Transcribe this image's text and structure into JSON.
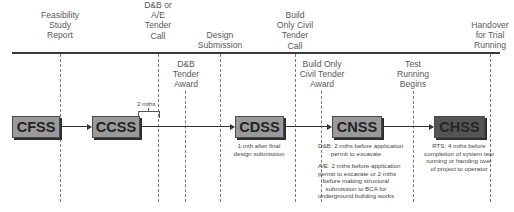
{
  "diagram": {
    "top_milestones": [
      {
        "id": "feasibility",
        "lines": [
          "Feasibility",
          "Study",
          "Report"
        ]
      },
      {
        "id": "dnb-ae-tender-call",
        "lines": [
          "D&B or",
          "A/E",
          "Tender",
          "Call"
        ]
      },
      {
        "id": "design-submission",
        "lines": [
          "Design",
          "Submission"
        ]
      },
      {
        "id": "build-only-civil-tender-call",
        "lines": [
          "Build",
          "Only Civil",
          "Tender",
          "Call"
        ]
      },
      {
        "id": "handover",
        "lines": [
          "Handover",
          "for Trial",
          "Running"
        ]
      }
    ],
    "lower_milestones": [
      {
        "id": "dnb-tender-award",
        "lines": [
          "D&B",
          "Tender",
          "Award"
        ]
      },
      {
        "id": "build-only-civil-tender-award",
        "lines": [
          "Build Only",
          "Civil Tender",
          "Award"
        ]
      },
      {
        "id": "test-running-begins",
        "lines": [
          "Test",
          "Running",
          "Begins"
        ]
      }
    ],
    "stages": [
      {
        "label": "CFSS",
        "style": "light"
      },
      {
        "label": "CCSS",
        "style": "light"
      },
      {
        "label": "CDSS",
        "style": "light"
      },
      {
        "label": "CNSS",
        "style": "light"
      },
      {
        "label": "CHSS",
        "style": "dark"
      }
    ],
    "gap_label": "2 mths",
    "notes": {
      "cdss": [
        "1 mth after final",
        "design submission"
      ],
      "cnss_dnb": [
        "D&B: 2 mths before application",
        "permit to excavate"
      ],
      "cnss_ae": [
        "A/E: 2 mths before application",
        "permit to excavate or 2 mths",
        "before making structural",
        "submission to BCA for",
        "underground building works"
      ],
      "chss": [
        "RTS: 4 mths before",
        "completion of system test",
        "running or handing over",
        "of project to operator"
      ]
    },
    "colors": {
      "box_light": "#9a9a9a",
      "box_dark": "#555555",
      "line": "#3a3a3a"
    }
  }
}
